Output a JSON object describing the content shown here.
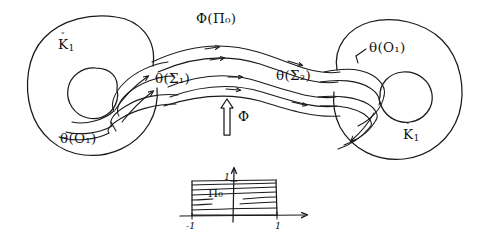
{
  "figure": {
    "ink_color": "#1a1a1a",
    "background_color": "#ffffff",
    "width": 491,
    "height": 247
  },
  "labels": {
    "phi_pi_zero": "Φ(Π₀)",
    "theta_sigma_1": "θ(Σ₁)",
    "theta_sigma_2": "θ(Σ₂)",
    "theta_o_left": "θ(O₁)",
    "theta_o_right": "θ(O₁)",
    "k_left_letter": "K",
    "k_left_sub": "1",
    "k_left_caron": "ˇ",
    "k_right_letter": "K",
    "k_right_sub": "1",
    "k_right_caron": "ˇ",
    "phi_arrow_label": "Φ"
  },
  "inset": {
    "region_label": "Π₀",
    "x_tick_left": "-1",
    "x_tick_right": "1",
    "y_tick_top": "1",
    "x_axis_name": "x-axis",
    "y_axis_name": "y-axis",
    "num_fill_lines": 7,
    "rect_x_from": -1,
    "rect_x_to": 1,
    "rect_y_from": 0,
    "rect_y_to": 1
  },
  "shapes": {
    "left_outer_circle": {
      "cx": 95,
      "cy": 84,
      "r": 68
    },
    "left_inner_circle": {
      "cx": 93,
      "cy": 95,
      "r": 26
    },
    "right_outer_circle": {
      "cx": 396,
      "cy": 88,
      "r": 68
    },
    "right_inner_circle": {
      "cx": 404,
      "cy": 98,
      "r": 26
    },
    "band_arrow_count": 6
  }
}
